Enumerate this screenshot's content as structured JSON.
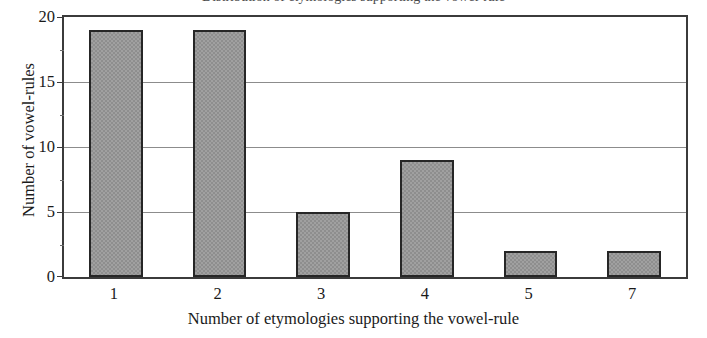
{
  "chart_data": {
    "type": "bar",
    "title": "Distribution of etymologies supporting the vowel-rule",
    "categories": [
      "1",
      "2",
      "3",
      "4",
      "5",
      "7"
    ],
    "values": [
      19,
      19,
      5,
      9,
      2,
      2
    ],
    "xlabel": "Number of etymologies supporting the vowel-rule",
    "ylabel": "Number of vowel-rules",
    "ylim": [
      0,
      20
    ],
    "ytick_labels": [
      "0",
      "5",
      "10",
      "15",
      "20"
    ],
    "ytick_values": [
      0,
      5,
      10,
      15,
      20
    ],
    "yminor_values": [
      2.5,
      7.5,
      12.5,
      17.5
    ],
    "grid": true,
    "legend": false,
    "colors": {
      "bar_fill": "#a0a0a0",
      "bar_edge": "#262626",
      "gridline": "#8c8c8c",
      "frame": "#3b3b3b",
      "background": "#ffffff",
      "text": "#1a1a1a"
    }
  }
}
